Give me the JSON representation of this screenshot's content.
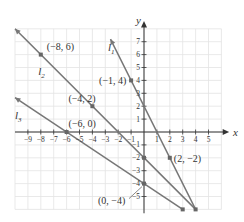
{
  "chart_data": {
    "type": "line",
    "title": "",
    "xlabel": "x",
    "ylabel": "y",
    "xlim": [
      -10,
      6
    ],
    "ylim": [
      -6,
      8
    ],
    "grid": true,
    "x_ticks": [
      -9,
      -8,
      -7,
      -6,
      -5,
      -4,
      -3,
      -2,
      -1,
      1,
      2,
      3,
      4,
      5
    ],
    "y_ticks": [
      -5,
      -4,
      -3,
      -2,
      -1,
      1,
      2,
      3,
      4,
      5,
      6,
      7
    ],
    "x_tick_labels": [
      "−9",
      "−8",
      "−7",
      "−6",
      "−5",
      "−4",
      "−3",
      "−2",
      "−1",
      "1",
      "2",
      "3",
      "4",
      "5"
    ],
    "y_tick_labels": [
      "−5",
      "−4",
      "−3",
      "−2",
      "−1",
      "1",
      "2",
      "3",
      "4",
      "5",
      "6",
      "7"
    ],
    "series": [
      {
        "name": "l1",
        "label": "l",
        "sub": "1",
        "equation": "y = -2x + 2",
        "x": [
          -2.6,
          4
        ],
        "y": [
          7.2,
          -6
        ],
        "points": [
          {
            "x": -1,
            "y": 4,
            "label": "(−1, 4)"
          },
          {
            "x": 2,
            "y": -2,
            "label": "(2, −2)"
          }
        ]
      },
      {
        "name": "l2",
        "label": "l",
        "sub": "2",
        "equation": "y = -x - 2",
        "x": [
          -10,
          4
        ],
        "y": [
          8,
          -6
        ],
        "points": [
          {
            "x": -8,
            "y": 6,
            "label": "(−8, 6)"
          },
          {
            "x": -4,
            "y": 2,
            "label": "(−4, 2)"
          },
          {
            "x": 0,
            "y": -2,
            "label": ""
          }
        ]
      },
      {
        "name": "l3",
        "label": "l",
        "sub": "3",
        "equation": "y = -2/3 x - 4",
        "x": [
          -10,
          3
        ],
        "y": [
          2.67,
          -6
        ],
        "points": [
          {
            "x": -6,
            "y": 0,
            "label": "(−6, 0)"
          },
          {
            "x": 0,
            "y": -4,
            "label": "(0, −4)"
          }
        ]
      }
    ]
  },
  "labels": {
    "x_axis": "x",
    "y_axis": "y"
  }
}
